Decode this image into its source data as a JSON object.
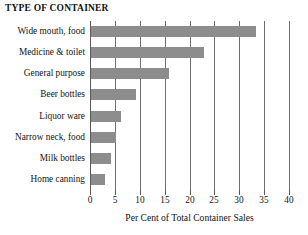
{
  "chart_data": {
    "type": "bar",
    "orientation": "horizontal",
    "title": "TYPE OF CONTAINER",
    "subtitle": "",
    "xlabel": "Per Cent of Total Container Sales",
    "ylabel": "",
    "categories": [
      "Wide mouth, food",
      "Medicine & toilet",
      "General purpose",
      "Beer bottles",
      "Liquor ware",
      "Narrow neck, food",
      "Milk bottles",
      "Home canning"
    ],
    "values": [
      33.2,
      22.7,
      15.7,
      9.1,
      6.0,
      5.0,
      4.0,
      2.8
    ],
    "xlim": [
      0,
      40
    ],
    "xticks": [
      0,
      5,
      10,
      15,
      20,
      25,
      30,
      35,
      40
    ],
    "xtick_labels": [
      "0",
      "5",
      "10",
      "15",
      "20",
      "25",
      "30",
      "35",
      "40"
    ],
    "grid": "vertical",
    "legend": null,
    "legend_position": "none",
    "bar_color": "#8d8d8d",
    "grid_color": "#6f6f6f",
    "axis_color": "#5a5a5a",
    "background": "#ffffff"
  }
}
